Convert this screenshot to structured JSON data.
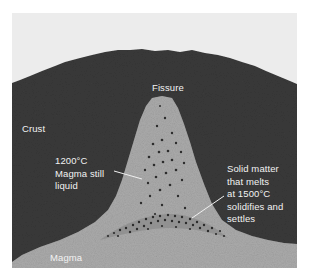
{
  "figure": {
    "colors": {
      "sky": "#ececec",
      "crust": "#3a3a3a",
      "magma": "#a8a8a8",
      "fissure_fill": "#b2b2b2",
      "solid_layer": "#8a8a8a",
      "particles": "#2a2a2a",
      "label_text": "#f2f2f2",
      "leader_line": "#f0f0f0"
    },
    "labels": {
      "fissure": "Fissure",
      "crust": "Crust",
      "liquid_temp": "1200°C",
      "liquid_line1": "Magma still",
      "liquid_line2": "liquid",
      "solid_line1": "Solid matter",
      "solid_line2": "that melts",
      "solid_line3": "at 1500°C",
      "solid_line4": "solidifies and",
      "solid_line5": "settles",
      "magma": "Magma"
    }
  }
}
